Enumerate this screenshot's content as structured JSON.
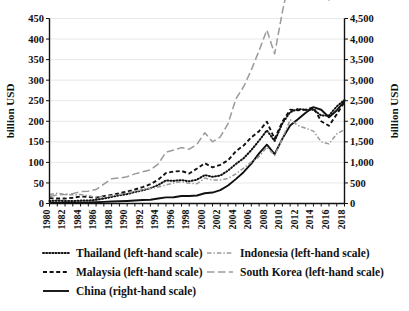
{
  "chart_data": {
    "type": "line",
    "title": "",
    "subtitle": "",
    "xlabel": "",
    "ylabel": "billion USD",
    "ylabel_right": "billion USD",
    "grid": true,
    "legend_position": "bottom",
    "x": [
      1980,
      1981,
      1982,
      1983,
      1984,
      1985,
      1986,
      1987,
      1988,
      1989,
      1990,
      1991,
      1992,
      1993,
      1994,
      1995,
      1996,
      1997,
      1998,
      1999,
      2000,
      2001,
      2002,
      2003,
      2004,
      2005,
      2006,
      2007,
      2008,
      2009,
      2010,
      2011,
      2012,
      2013,
      2014,
      2015,
      2016,
      2017,
      2018
    ],
    "xtick_labels": [
      "1980",
      "1982",
      "1984",
      "1986",
      "1988",
      "1990",
      "1992",
      "1994",
      "1996",
      "1998",
      "2000",
      "2002",
      "2004",
      "2006",
      "2008",
      "2010",
      "2012",
      "2014",
      "2016",
      "2018"
    ],
    "xlim": [
      1980,
      2018
    ],
    "ylim_left": [
      0,
      450
    ],
    "ylim_right": [
      0,
      4500
    ],
    "ytick_labels_left": [
      "0",
      "50",
      "100",
      "150",
      "200",
      "250",
      "300",
      "350",
      "400",
      "450"
    ],
    "ytick_values_left": [
      0,
      50,
      100,
      150,
      200,
      250,
      300,
      350,
      400,
      450
    ],
    "ytick_labels_right": [
      "0",
      "500",
      "1,000",
      "1,500",
      "2,000",
      "2,500",
      "3,000",
      "3,500",
      "4,000",
      "4,500"
    ],
    "ytick_values_right": [
      0,
      500,
      1000,
      1500,
      2000,
      2500,
      3000,
      3500,
      4000,
      4500
    ],
    "series": [
      {
        "name": "Thailand (left-hand scale)",
        "axis": "left",
        "style": "dotted",
        "color": "#111111",
        "values": [
          6,
          7,
          6,
          6,
          7,
          7,
          9,
          12,
          16,
          20,
          23,
          28,
          32,
          37,
          45,
          56,
          55,
          57,
          54,
          58,
          69,
          65,
          68,
          80,
          96,
          110,
          130,
          153,
          178,
          152,
          195,
          222,
          230,
          228,
          228,
          214,
          214,
          236,
          252
        ]
      },
      {
        "name": "Malaysia (left-hand scale)",
        "axis": "left",
        "style": "dashed-short",
        "color": "#111111",
        "values": [
          13,
          12,
          12,
          14,
          17,
          16,
          14,
          18,
          21,
          25,
          29,
          34,
          40,
          47,
          58,
          74,
          78,
          79,
          73,
          85,
          98,
          88,
          94,
          105,
          127,
          141,
          161,
          176,
          199,
          157,
          199,
          228,
          227,
          228,
          234,
          200,
          189,
          217,
          247
        ]
      },
      {
        "name": "China (right-hand scale)",
        "axis": "right",
        "style": "solid",
        "color": "#111111",
        "values": [
          18,
          22,
          22,
          22,
          26,
          27,
          31,
          39,
          48,
          53,
          62,
          72,
          85,
          92,
          121,
          149,
          151,
          183,
          184,
          195,
          249,
          266,
          326,
          438,
          593,
          762,
          969,
          1220,
          1430,
          1202,
          1578,
          1898,
          2049,
          2209,
          2342,
          2281,
          2098,
          2263,
          2487
        ]
      },
      {
        "name": "Indonesia (left-hand scale)",
        "axis": "left",
        "style": "dash-dot",
        "color": "#9a9a9a",
        "values": [
          22,
          25,
          22,
          21,
          22,
          19,
          15,
          17,
          19,
          22,
          26,
          29,
          34,
          37,
          40,
          45,
          50,
          53,
          49,
          48,
          62,
          57,
          57,
          61,
          72,
          86,
          101,
          114,
          137,
          117,
          158,
          204,
          190,
          183,
          176,
          150,
          145,
          169,
          180
        ]
      },
      {
        "name": "South Korea (left-hand scale)",
        "axis": "left",
        "style": "dashed-long",
        "color": "#9a9a9a",
        "values": [
          17,
          21,
          22,
          24,
          29,
          30,
          34,
          47,
          60,
          62,
          65,
          72,
          77,
          82,
          96,
          125,
          130,
          136,
          132,
          144,
          172,
          150,
          162,
          194,
          254,
          284,
          325,
          372,
          422,
          364,
          466,
          555,
          548,
          560,
          573,
          527,
          495,
          574,
          605
        ]
      }
    ],
    "legend": [
      {
        "label": "Thailand (left-hand scale)",
        "style": "dotted",
        "color": "#111111"
      },
      {
        "label": "Indonesia (left-hand scale)",
        "style": "dash-dot",
        "color": "#9a9a9a"
      },
      {
        "label": "Malaysia (left-hand scale)",
        "style": "dashed-short",
        "color": "#111111"
      },
      {
        "label": "South Korea (left-hand scale)",
        "style": "dashed-long",
        "color": "#9a9a9a"
      },
      {
        "label": "China (right-hand scale)",
        "style": "solid",
        "color": "#111111"
      }
    ]
  }
}
